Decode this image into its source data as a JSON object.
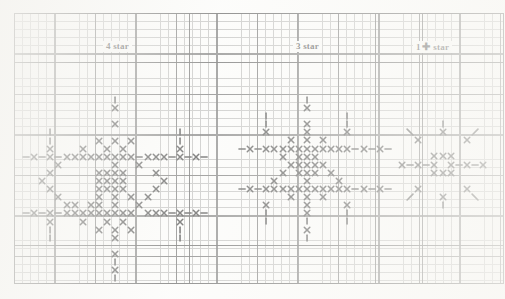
{
  "document": {
    "kind": "cross-stitch pattern chart",
    "background_color": "#fdfdfc",
    "grid": {
      "cell_px": 8.1,
      "bold_every": 5,
      "fine_line_color": "#8d8d8d",
      "bold_line_color": "#3a3a3a",
      "cols": 60,
      "rows": 33
    }
  },
  "labels": [
    {
      "id": "label-4-star",
      "text": "4 star",
      "left": 103,
      "top": 41
    },
    {
      "id": "label-3-star",
      "text": "3 star",
      "left": 293,
      "top": 41
    },
    {
      "id": "label-1-star",
      "text": "1",
      "plus": "✚",
      "suffix": "star",
      "left": 413,
      "top": 41
    }
  ],
  "reference_lines": {
    "horizontal": [
      49,
      232
    ],
    "vertical": [
      175,
      361,
      408
    ]
  },
  "motifs": [
    {
      "id": "motif-4-star",
      "name": "four-star-motif",
      "label": "4 star",
      "size": "large",
      "origin_left": 22,
      "origin_top": 96,
      "stitches": {
        "cross": [
          [
            11,
            1
          ],
          [
            11,
            3
          ],
          [
            9,
            5
          ],
          [
            11,
            5
          ],
          [
            13,
            5
          ],
          [
            7,
            6
          ],
          [
            10,
            6
          ],
          [
            12,
            6
          ],
          [
            1,
            7
          ],
          [
            3,
            7
          ],
          [
            5,
            7
          ],
          [
            6,
            7
          ],
          [
            7,
            7
          ],
          [
            8,
            7
          ],
          [
            9,
            7
          ],
          [
            10,
            7
          ],
          [
            11,
            7
          ],
          [
            12,
            7
          ],
          [
            13,
            7
          ],
          [
            15,
            7
          ],
          [
            16,
            7
          ],
          [
            17,
            7
          ],
          [
            19,
            7
          ],
          [
            21,
            7
          ],
          [
            4,
            8
          ],
          [
            11,
            8
          ],
          [
            14,
            8
          ],
          [
            3,
            9
          ],
          [
            9,
            9
          ],
          [
            10,
            9
          ],
          [
            11,
            9
          ],
          [
            12,
            9
          ],
          [
            16,
            9
          ],
          [
            2,
            10
          ],
          [
            9,
            10
          ],
          [
            10,
            10
          ],
          [
            11,
            10
          ],
          [
            12,
            10
          ],
          [
            17,
            10
          ],
          [
            3,
            11
          ],
          [
            9,
            11
          ],
          [
            10,
            11
          ],
          [
            11,
            11
          ],
          [
            12,
            11
          ],
          [
            16,
            11
          ],
          [
            4,
            12
          ],
          [
            9,
            12
          ],
          [
            11,
            12
          ],
          [
            13,
            12
          ],
          [
            15,
            12
          ],
          [
            5,
            13
          ],
          [
            6,
            13
          ],
          [
            8,
            13
          ],
          [
            9,
            13
          ],
          [
            11,
            13
          ],
          [
            14,
            13
          ],
          [
            1,
            14
          ],
          [
            3,
            14
          ],
          [
            5,
            14
          ],
          [
            6,
            14
          ],
          [
            7,
            14
          ],
          [
            8,
            14
          ],
          [
            9,
            14
          ],
          [
            10,
            14
          ],
          [
            11,
            14
          ],
          [
            12,
            14
          ],
          [
            13,
            14
          ],
          [
            15,
            14
          ],
          [
            16,
            14
          ],
          [
            17,
            14
          ],
          [
            19,
            14
          ],
          [
            21,
            14
          ],
          [
            7,
            15
          ],
          [
            10,
            15
          ],
          [
            12,
            15
          ],
          [
            9,
            16
          ],
          [
            11,
            16
          ],
          [
            13,
            16
          ],
          [
            11,
            17
          ],
          [
            3,
            6
          ],
          [
            19,
            6
          ],
          [
            3,
            15
          ],
          [
            19,
            15
          ],
          [
            11,
            19
          ],
          [
            11,
            21
          ]
        ],
        "vertical_dash": [
          [
            11,
            0
          ],
          [
            3,
            5
          ],
          [
            19,
            5
          ],
          [
            3,
            16
          ],
          [
            19,
            16
          ],
          [
            11,
            20
          ],
          [
            11,
            22
          ],
          [
            3,
            4
          ],
          [
            19,
            4
          ],
          [
            3,
            17
          ],
          [
            19,
            17
          ]
        ],
        "horizontal_dash": [
          [
            0,
            7
          ],
          [
            2,
            7
          ],
          [
            4,
            7
          ],
          [
            14,
            7
          ],
          [
            18,
            7
          ],
          [
            20,
            7
          ],
          [
            22,
            7
          ],
          [
            0,
            14
          ],
          [
            2,
            14
          ],
          [
            4,
            14
          ],
          [
            18,
            14
          ],
          [
            20,
            14
          ],
          [
            22,
            14
          ]
        ]
      }
    },
    {
      "id": "motif-3-star",
      "name": "three-star-motif",
      "label": "3 star",
      "size": "medium",
      "origin_left": 238,
      "origin_top": 104,
      "stitches": {
        "cross": [
          [
            8,
            0
          ],
          [
            8,
            2
          ],
          [
            3,
            3
          ],
          [
            8,
            3
          ],
          [
            13,
            3
          ],
          [
            6,
            4
          ],
          [
            8,
            4
          ],
          [
            10,
            4
          ],
          [
            1,
            5
          ],
          [
            3,
            5
          ],
          [
            4,
            5
          ],
          [
            5,
            5
          ],
          [
            6,
            5
          ],
          [
            7,
            5
          ],
          [
            8,
            5
          ],
          [
            9,
            5
          ],
          [
            10,
            5
          ],
          [
            11,
            5
          ],
          [
            12,
            5
          ],
          [
            13,
            5
          ],
          [
            15,
            5
          ],
          [
            17,
            5
          ],
          [
            5,
            6
          ],
          [
            7,
            6
          ],
          [
            8,
            6
          ],
          [
            9,
            6
          ],
          [
            6,
            7
          ],
          [
            7,
            7
          ],
          [
            8,
            7
          ],
          [
            9,
            7
          ],
          [
            10,
            7
          ],
          [
            5,
            8
          ],
          [
            7,
            8
          ],
          [
            8,
            8
          ],
          [
            9,
            8
          ],
          [
            11,
            8
          ],
          [
            4,
            9
          ],
          [
            8,
            9
          ],
          [
            12,
            9
          ],
          [
            1,
            10
          ],
          [
            3,
            10
          ],
          [
            4,
            10
          ],
          [
            5,
            10
          ],
          [
            6,
            10
          ],
          [
            7,
            10
          ],
          [
            8,
            10
          ],
          [
            9,
            10
          ],
          [
            10,
            10
          ],
          [
            11,
            10
          ],
          [
            12,
            10
          ],
          [
            13,
            10
          ],
          [
            15,
            10
          ],
          [
            17,
            10
          ],
          [
            6,
            11
          ],
          [
            8,
            11
          ],
          [
            10,
            11
          ],
          [
            3,
            12
          ],
          [
            8,
            12
          ],
          [
            13,
            12
          ],
          [
            8,
            13
          ],
          [
            8,
            15
          ]
        ],
        "vertical_dash": [
          [
            8,
            -1
          ],
          [
            3,
            2
          ],
          [
            13,
            2
          ],
          [
            3,
            13
          ],
          [
            13,
            13
          ],
          [
            8,
            14
          ],
          [
            8,
            16
          ],
          [
            3,
            1
          ],
          [
            13,
            1
          ],
          [
            3,
            14
          ],
          [
            13,
            14
          ]
        ],
        "horizontal_dash": [
          [
            0,
            5
          ],
          [
            2,
            5
          ],
          [
            14,
            5
          ],
          [
            16,
            5
          ],
          [
            18,
            5
          ],
          [
            0,
            10
          ],
          [
            2,
            10
          ],
          [
            14,
            10
          ],
          [
            16,
            10
          ],
          [
            18,
            10
          ]
        ]
      }
    },
    {
      "id": "motif-1-star",
      "name": "one-star-motif",
      "label": "1 ✚ star",
      "size": "small",
      "origin_left": 398,
      "origin_top": 120,
      "stitches": {
        "cross": [
          [
            5,
            1
          ],
          [
            2,
            2
          ],
          [
            8,
            2
          ],
          [
            4,
            4
          ],
          [
            5,
            4
          ],
          [
            6,
            4
          ],
          [
            0,
            5
          ],
          [
            2,
            5
          ],
          [
            4,
            5
          ],
          [
            6,
            5
          ],
          [
            8,
            5
          ],
          [
            10,
            5
          ],
          [
            4,
            6
          ],
          [
            5,
            6
          ],
          [
            6,
            6
          ],
          [
            2,
            8
          ],
          [
            8,
            8
          ],
          [
            5,
            9
          ]
        ],
        "vertical_dash": [
          [
            5,
            0
          ],
          [
            5,
            10
          ]
        ],
        "horizontal_dash": [
          [
            1,
            5
          ],
          [
            3,
            5
          ],
          [
            7,
            5
          ],
          [
            9,
            5
          ]
        ],
        "diagonal_nw": [
          [
            1,
            1
          ],
          [
            9,
            9
          ]
        ],
        "diagonal_ne": [
          [
            9,
            1
          ],
          [
            1,
            9
          ]
        ]
      }
    }
  ]
}
